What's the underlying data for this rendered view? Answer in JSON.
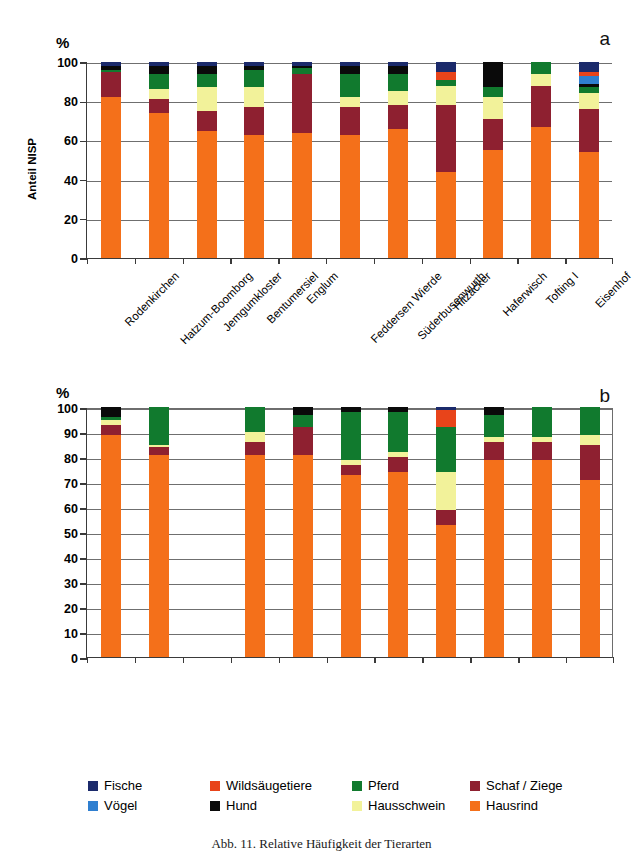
{
  "figure": {
    "caption": "Abb. 11.  Relative Häufigkeit der Tierarten",
    "panel_a_letter": "a",
    "panel_b_letter": "b",
    "percent_symbol": "%"
  },
  "legend": {
    "position": "bottom",
    "entries": [
      {
        "label": "Fische",
        "color": "#1b2a6b"
      },
      {
        "label": "Wildsäugetiere",
        "color": "#e8441a"
      },
      {
        "label": "Pferd",
        "color": "#117a2e"
      },
      {
        "label": "Schaf / Ziege",
        "color": "#8e2030"
      },
      {
        "label": "Vögel",
        "color": "#2f7fd0"
      },
      {
        "label": "Hund",
        "color": "#0a0a0a"
      },
      {
        "label": "Hausschwein",
        "color": "#f2f29a"
      },
      {
        "label": "Hausrind",
        "color": "#f4701a"
      }
    ]
  },
  "chart_data": [
    {
      "id": "panel_a",
      "type": "bar",
      "stacked": true,
      "title": "a",
      "xlabel": "",
      "ylabel": "Anteil NISP",
      "yunit": "%",
      "ylim": [
        0,
        100
      ],
      "yticks": [
        0,
        20,
        40,
        60,
        80,
        100
      ],
      "grid": true,
      "categories": [
        "Rodenkirchen",
        "Hatzum-Boomborg",
        "Jemgumkloster",
        "Bentumersiel",
        "Englum",
        "Feddersen Wierde",
        "Süderbusenwurth",
        "Hitzacker",
        "Haferwisch",
        "Tofting I",
        "Eisenhof"
      ],
      "series": [
        {
          "name": "Hausrind",
          "color": "#f4701a",
          "values": [
            82,
            74,
            65,
            63,
            64,
            63,
            66,
            44,
            55,
            67,
            54
          ]
        },
        {
          "name": "Schaf / Ziege",
          "color": "#8e2030",
          "values": [
            13,
            7,
            10,
            14,
            30,
            14,
            12,
            34,
            16,
            21,
            22
          ]
        },
        {
          "name": "Hausschwein",
          "color": "#f2f29a",
          "values": [
            0,
            5,
            12,
            10,
            0,
            5,
            7,
            10,
            11,
            6,
            8
          ]
        },
        {
          "name": "Pferd",
          "color": "#117a2e",
          "values": [
            1,
            8,
            7,
            9,
            3,
            12,
            9,
            3,
            5,
            6,
            3
          ]
        },
        {
          "name": "Hund",
          "color": "#0a0a0a",
          "values": [
            2,
            4,
            4,
            2,
            1,
            4,
            4,
            0,
            13,
            0,
            2
          ]
        },
        {
          "name": "Vögel",
          "color": "#2f7fd0",
          "values": [
            0,
            0,
            0,
            0,
            0,
            0,
            0,
            0,
            0,
            0,
            4
          ]
        },
        {
          "name": "Wildsäugetiere",
          "color": "#e8441a",
          "values": [
            0,
            0,
            0,
            0,
            0,
            0,
            0,
            4,
            0,
            0,
            2
          ]
        },
        {
          "name": "Fische",
          "color": "#1b2a6b",
          "values": [
            2,
            2,
            2,
            2,
            2,
            2,
            2,
            5,
            0,
            0,
            5
          ]
        }
      ]
    },
    {
      "id": "panel_b",
      "type": "bar",
      "stacked": true,
      "title": "b",
      "xlabel": "",
      "ylabel": "Anteil Gewicht",
      "yunit": "%",
      "ylim": [
        0,
        100
      ],
      "yticks": [
        0,
        10,
        20,
        30,
        40,
        50,
        60,
        70,
        80,
        90,
        100
      ],
      "grid": true,
      "categories": [
        "Rodenkirchen",
        "Hatzum-Boomborg",
        "Jemgumkloster",
        "Bentumersiel",
        "Englum",
        "Feddersen Wierde",
        "Süderbusenwurth",
        "Hitzacker",
        "Haferwisch",
        "Tofting I",
        "Eisenhof"
      ],
      "series": [
        {
          "name": "Hausrind",
          "color": "#f4701a",
          "values": [
            89,
            81,
            0,
            81,
            81,
            73,
            74,
            53,
            79,
            79,
            71
          ]
        },
        {
          "name": "Schaf / Ziege",
          "color": "#8e2030",
          "values": [
            4,
            3,
            0,
            5,
            11,
            4,
            6,
            6,
            7,
            7,
            14
          ]
        },
        {
          "name": "Hausschwein",
          "color": "#f2f29a",
          "values": [
            2,
            1,
            0,
            4,
            0,
            2,
            2,
            15,
            2,
            2,
            4
          ]
        },
        {
          "name": "Pferd",
          "color": "#117a2e",
          "values": [
            1,
            15,
            0,
            10,
            5,
            19,
            16,
            18,
            9,
            12,
            11
          ]
        },
        {
          "name": "Hund",
          "color": "#0a0a0a",
          "values": [
            4,
            0,
            0,
            0,
            3,
            2,
            2,
            0,
            3,
            0,
            0
          ]
        },
        {
          "name": "Wildsäugetiere",
          "color": "#e8441a",
          "values": [
            0,
            0,
            0,
            0,
            0,
            0,
            0,
            7,
            0,
            0,
            0
          ]
        },
        {
          "name": "Fische",
          "color": "#1b2a6b",
          "values": [
            0,
            0,
            0,
            0,
            0,
            0,
            0,
            1,
            0,
            0,
            0
          ]
        }
      ]
    }
  ]
}
